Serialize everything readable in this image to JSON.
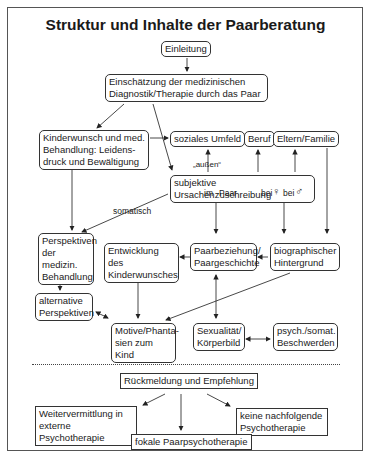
{
  "title": "Struktur und Inhalte der Paarberatung",
  "nodes": {
    "einleitung": "Einleitung",
    "einschaetzung": "Einschätzung der medizinischen\nDiagnostik/Therapie durch das Paar",
    "kinderwunsch": "Kinderwunsch und med.\nBehandlung: Leidens-\ndruck und Bewältigung",
    "umfeld": "soziales Umfeld",
    "beruf": "Beruf",
    "eltern": "Eltern/Familie",
    "ursachen": "subjektive Ursachenzuschreibung",
    "perspektiven": "Perspektiven\nder medizin.\nBehandlung",
    "entwicklung": "Entwicklung des\nKinderwunsches",
    "paarbeziehung": "Paarbeziehung/\nPaargeschichte",
    "biographisch": "biographischer\nHintergrund",
    "alternative": "alternative\nPerspektiven",
    "motive": "Motive/Phanta-\nsien zum Kind",
    "sexualitaet": "Sexualität/\nKörperbild",
    "beschwerden": "psych./somat.\nBeschwerden",
    "rueckmeldung": "Rückmeldung und Empfehlung",
    "weitervermittlung": "Weitervermittlung in\nexterne Psychotherapie",
    "keine": "keine nachfolgende\nPsychotherapie",
    "fokale": "fokale Paarpsychotherapie"
  },
  "labels": {
    "aussen": "„außen“",
    "somatisch": "somatisch",
    "im": "im",
    "paar": "Paar",
    "bei1": "bei",
    "bei2": "bei",
    "female": "♀",
    "male": "♂"
  }
}
